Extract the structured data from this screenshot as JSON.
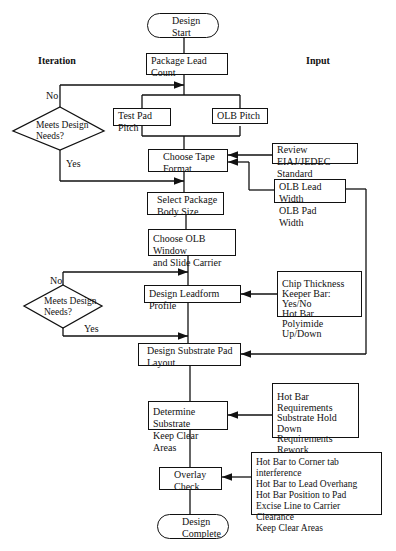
{
  "headers": {
    "left": "Iteration",
    "right": "Input"
  },
  "nodes": {
    "start": "Design\nStart",
    "package_lead_count": "Package Lead\nCount",
    "test_pad_pitch": "Test Pad Pitch",
    "olb_pitch": "OLB Pitch",
    "choose_tape_format": "Choose Tape\nFormat",
    "select_package_body_size": "Select Package\nBody Size",
    "choose_olb_window": "Choose OLB Window\nand Slide Carrier",
    "design_leadform_profile": "Design Leadform Profile",
    "design_substrate_pad_layout": "Design Substrate Pad\nLayout",
    "determine_keep_clear": "Determine Substrate\nKeep Clear Areas",
    "overlay_check": "Overlay\nCheck",
    "complete": "Design\nComplete"
  },
  "decisions": [
    {
      "text": "Meets Design\nNeeds?",
      "no": "No",
      "yes": "Yes"
    },
    {
      "text": "Meets Design\nNeeds?",
      "no": "No",
      "yes": "Yes"
    }
  ],
  "inputs": {
    "review_standard": "Review EIAJ/JEDEC\nStandard",
    "olb_widths": "OLB Lead Width\nOLB Pad Width",
    "leadform_inputs": "Chip Thickness\nKeeper Bar: Yes/No\nHot Bar\nPolyimide Up/Down",
    "keep_clear_inputs": "Hot Bar Requirements\nSubstrate Hold Down\nRequirements\nRework Requirements",
    "overlay_inputs": "Hot Bar to Corner tab interference\nHot Bar to Lead Overhang\nHot Bar Position to Pad\nExcise Line to Carrier Clearance\nKeep Clear Areas"
  }
}
